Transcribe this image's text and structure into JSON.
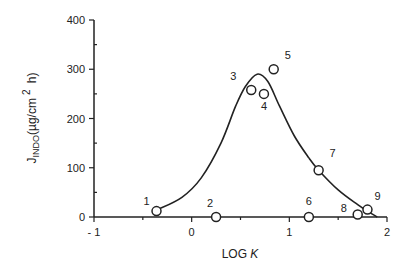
{
  "chart_data": {
    "type": "scatter",
    "title": "",
    "xlabel": "LOG K",
    "ylabel": "J_INDO(µg/cm2 h)",
    "xlim": [
      -1,
      2
    ],
    "ylim": [
      0,
      400
    ],
    "x_ticks": [
      "- 1",
      "0",
      "1",
      "2"
    ],
    "y_ticks": [
      "0",
      "100",
      "200",
      "300",
      "400"
    ],
    "grid": false,
    "legend": null,
    "series": [
      {
        "name": "observed",
        "marker": "open-circle",
        "points": [
          {
            "label": "1",
            "x": -0.36,
            "y": 12
          },
          {
            "label": "2",
            "x": 0.25,
            "y": 0
          },
          {
            "label": "3",
            "x": 0.61,
            "y": 258
          },
          {
            "label": "4",
            "x": 0.74,
            "y": 250
          },
          {
            "label": "5",
            "x": 0.84,
            "y": 300
          },
          {
            "label": "6",
            "x": 1.2,
            "y": 0
          },
          {
            "label": "7",
            "x": 1.3,
            "y": 95
          },
          {
            "label": "8",
            "x": 1.7,
            "y": 5
          },
          {
            "label": "9",
            "x": 1.8,
            "y": 15
          }
        ]
      },
      {
        "name": "fitted curve",
        "type": "line",
        "points": [
          {
            "x": -0.36,
            "y": 14
          },
          {
            "x": -0.1,
            "y": 40
          },
          {
            "x": 0.1,
            "y": 80
          },
          {
            "x": 0.3,
            "y": 150
          },
          {
            "x": 0.45,
            "y": 225
          },
          {
            "x": 0.55,
            "y": 265
          },
          {
            "x": 0.67,
            "y": 290
          },
          {
            "x": 0.78,
            "y": 275
          },
          {
            "x": 0.9,
            "y": 225
          },
          {
            "x": 1.05,
            "y": 165
          },
          {
            "x": 1.2,
            "y": 120
          },
          {
            "x": 1.3,
            "y": 95
          },
          {
            "x": 1.5,
            "y": 55
          },
          {
            "x": 1.7,
            "y": 25
          },
          {
            "x": 1.8,
            "y": 12
          },
          {
            "x": 1.9,
            "y": 0
          }
        ]
      }
    ]
  },
  "labels": {
    "xlabel_main": "LOG ",
    "xlabel_italic": "K",
    "ylabel_main": "J",
    "ylabel_sub": "INDO",
    "ylabel_unit": "(µg/cm",
    "ylabel_sup": "2",
    "ylabel_end": " h)"
  }
}
